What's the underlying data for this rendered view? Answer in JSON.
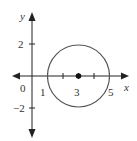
{
  "diagram": {
    "type": "circle-on-coordinate-plane",
    "axes": {
      "x_label": "x",
      "y_label": "y"
    },
    "x_ticks": [
      {
        "value": 0,
        "label": "0"
      },
      {
        "value": 1,
        "label": "1"
      },
      {
        "value": 3,
        "label": "3"
      },
      {
        "value": 5,
        "label": "5"
      }
    ],
    "y_ticks": [
      {
        "value": 2,
        "label": "2"
      },
      {
        "value": -2,
        "label": "−2"
      }
    ],
    "circle": {
      "center": [
        3,
        0
      ],
      "radius": 2
    },
    "colors": {
      "stroke": "#555555",
      "axis": "#222222"
    }
  }
}
